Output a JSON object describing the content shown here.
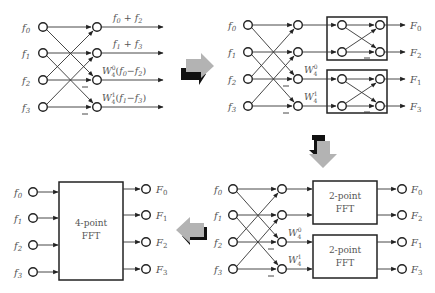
{
  "panels": {
    "butterfly": {
      "inputs": [
        "f0",
        "f1",
        "f2",
        "f3"
      ],
      "outputs": [
        "f0 + f2",
        "f1 + f3",
        "W4^0 (f0 − f2)",
        "W4^1 (f1 − f3)"
      ],
      "minus_marks": 2
    },
    "two_stage": {
      "inputs": [
        "f0",
        "f1",
        "f2",
        "f3"
      ],
      "twiddles": [
        "W4^0",
        "W4^1"
      ],
      "outputs": [
        "F0",
        "F2",
        "F1",
        "F3"
      ],
      "boxes": 2
    },
    "two_point_blocks": {
      "inputs": [
        "f0",
        "f1",
        "f2",
        "f3"
      ],
      "twiddles": [
        "W4^0",
        "W4^1"
      ],
      "block_label_line1": "2-point",
      "block_label_line2": "FFT",
      "outputs": [
        "F0",
        "F2",
        "F1",
        "F3"
      ]
    },
    "four_point_block": {
      "inputs": [
        "f0",
        "f1",
        "f2",
        "f3"
      ],
      "block_label_line1": "4-point",
      "block_label_line2": "FFT",
      "outputs": [
        "F0",
        "F1",
        "F2",
        "F3"
      ]
    }
  },
  "flow_arrows": [
    "right",
    "down",
    "left"
  ],
  "colors": {
    "arrow_gray": "#b3b3b3",
    "arrow_black": "#111111",
    "line": "#333333",
    "text": "#555555"
  }
}
